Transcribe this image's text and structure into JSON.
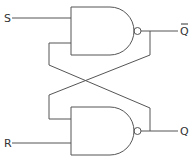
{
  "diagram": {
    "labels": {
      "s": "S",
      "r": "R",
      "q": "Q",
      "q_bar": "Q"
    },
    "gates": [
      {
        "id": "top-nand",
        "type": "NAND",
        "inputs": [
          "S",
          "Q"
        ],
        "output": "Q̄"
      },
      {
        "id": "bottom-nand",
        "type": "NAND",
        "inputs": [
          "Q̄",
          "R"
        ],
        "output": "Q"
      }
    ],
    "colors": {
      "line": "#555555",
      "text": "#333333",
      "background": "#ffffff"
    }
  }
}
